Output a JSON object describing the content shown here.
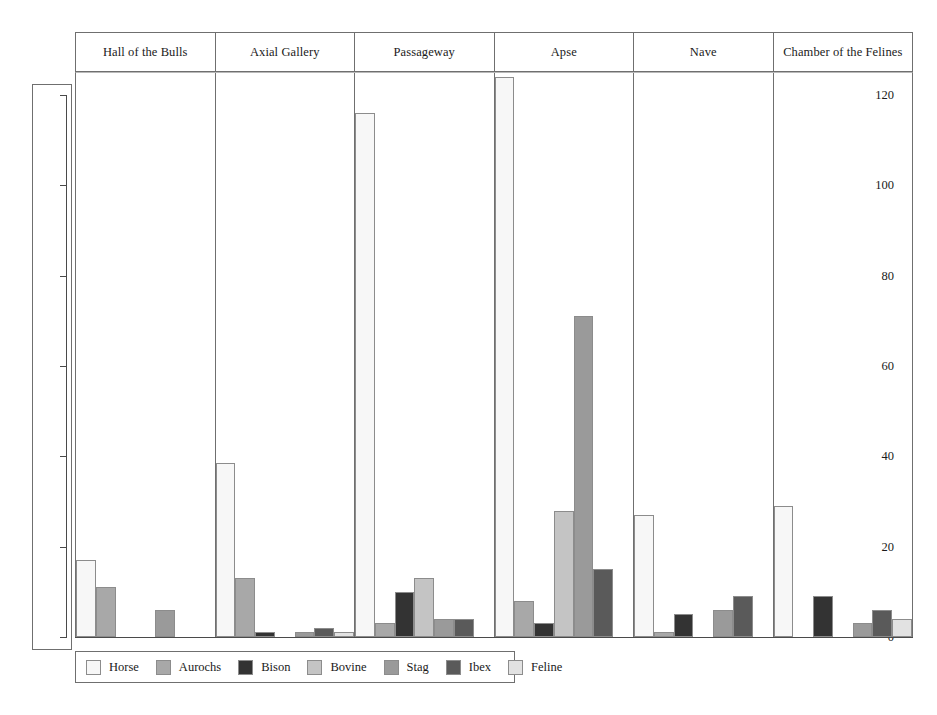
{
  "chart_data": {
    "type": "bar",
    "title": "",
    "xlabel": "",
    "ylabel": "",
    "ylim": [
      0,
      125
    ],
    "yticks": [
      0,
      20,
      40,
      60,
      80,
      100,
      120
    ],
    "ytick_labels": [
      "0",
      "20",
      "40",
      "60",
      "80",
      "100",
      "120"
    ],
    "grid": false,
    "legend_position": "bottom-left",
    "panels": [
      "Hall of the Bulls",
      "Axial Gallery",
      "Passageway",
      "Apse",
      "Nave",
      "Chamber of the Felines"
    ],
    "categories": [
      "Horse",
      "Aurochs",
      "Bison",
      "Bovine",
      "Stag",
      "Ibex",
      "Feline"
    ],
    "colors": {
      "Horse": "#f7f7f7",
      "Aurochs": "#a8a8a8",
      "Bison": "#333333",
      "Bovine": "#c4c4c4",
      "Stag": "#9a9a9a",
      "Ibex": "#5a5a5a",
      "Feline": "#e2e2e2"
    },
    "series": [
      {
        "name": "Hall of the Bulls",
        "values": [
          17,
          11,
          0,
          0,
          6,
          0,
          0
        ]
      },
      {
        "name": "Axial Gallery",
        "values": [
          38.5,
          13,
          1,
          0,
          1,
          2,
          1
        ]
      },
      {
        "name": "Passageway",
        "values": [
          116,
          3,
          10,
          13,
          4,
          4,
          0
        ]
      },
      {
        "name": "Apse",
        "values": [
          124,
          8,
          3,
          28,
          71,
          15,
          0
        ]
      },
      {
        "name": "Nave",
        "values": [
          27,
          1,
          5,
          0,
          6,
          9,
          0
        ]
      },
      {
        "name": "Chamber of the Felines",
        "values": [
          29,
          0,
          9,
          0,
          3,
          6,
          4
        ]
      }
    ]
  },
  "legend": {
    "items": [
      {
        "label": "Horse",
        "color": "#f7f7f7"
      },
      {
        "label": "Aurochs",
        "color": "#a8a8a8"
      },
      {
        "label": "Bison",
        "color": "#333333"
      },
      {
        "label": "Bovine",
        "color": "#c4c4c4"
      },
      {
        "label": "Stag",
        "color": "#9a9a9a"
      },
      {
        "label": "Ibex",
        "color": "#5a5a5a"
      },
      {
        "label": "Feline",
        "color": "#e2e2e2"
      }
    ]
  }
}
